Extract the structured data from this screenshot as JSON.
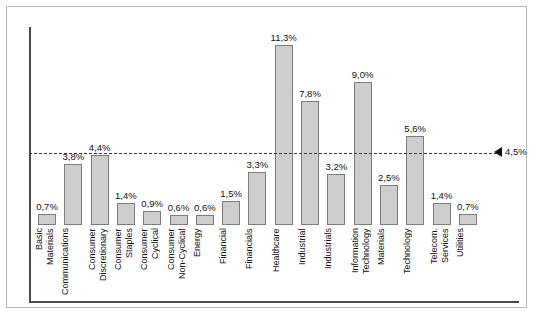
{
  "chart_data": {
    "type": "bar",
    "title": "",
    "xlabel": "",
    "ylabel": "",
    "ylim": [
      0,
      12.5
    ],
    "grid": false,
    "legend": "none",
    "value_suffix": "%",
    "decimal_separator": ",",
    "categories": [
      "Basic\nMaterials",
      "Communications",
      "Consumer\nDiscretionary",
      "Consumer\nStaples",
      "Consumer\nCyclical",
      "Consumer\nNon-Cyclical",
      "Energy",
      "Financial",
      "Financials",
      "Healthcare",
      "Industrial",
      "Industrials",
      "Information\nTechnology",
      "Materials",
      "Technology",
      "Telecom.\nServices",
      "Utilities"
    ],
    "values": [
      0.7,
      3.8,
      4.4,
      1.4,
      0.9,
      0.6,
      0.6,
      1.5,
      3.3,
      11.3,
      7.8,
      3.2,
      9.0,
      2.5,
      5.6,
      1.4,
      0.7
    ],
    "value_labels": [
      "0,7%",
      "3,8%",
      "4,4%",
      "1,4%",
      "0,9%",
      "0,6%",
      "0,6%",
      "1,5%",
      "3,3%",
      "11,3%",
      "7,8%",
      "3,2%",
      "9,0%",
      "2,5%",
      "5,6%",
      "1,4%",
      "0,7%"
    ],
    "annotations": [
      {
        "name": "reference-line",
        "type": "hline",
        "value": 4.5,
        "label": "4,5%",
        "style": "dashed",
        "marker": "left-triangle"
      }
    ],
    "colors": {
      "bar_fill": "#cdcdcd",
      "bar_stroke": "#7c7c7c",
      "axis": "#4a4a4a",
      "reference_line": "#3b3b3b",
      "frame": "#b9b9b9",
      "text": "#111111",
      "background": "#ffffff"
    }
  }
}
